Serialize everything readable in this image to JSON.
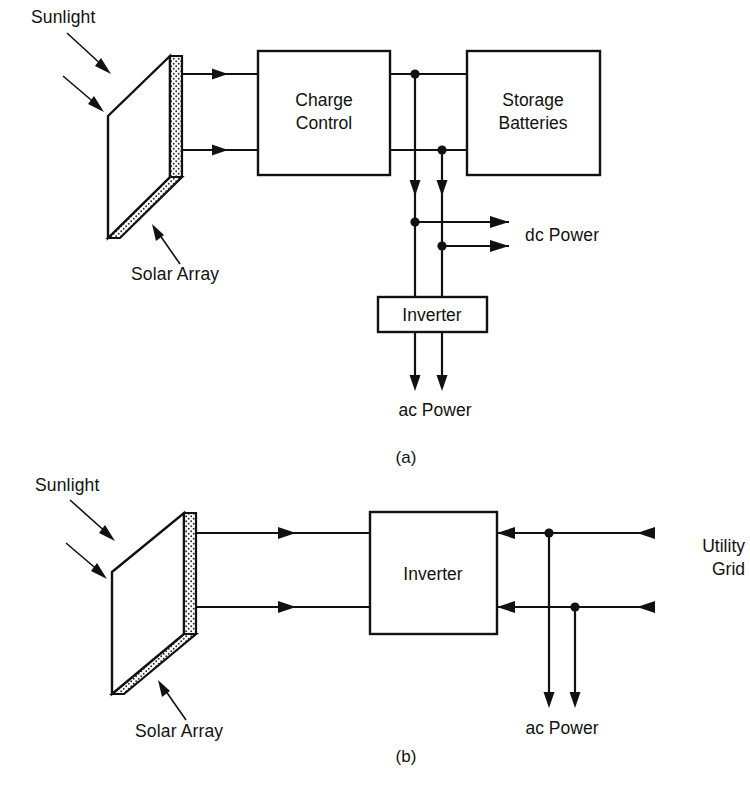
{
  "figure": {
    "background": "#ffffff",
    "ink": "#111111"
  },
  "panel_a": {
    "caption": "(a)",
    "sunlight_label": "Sunlight",
    "solar_array_label": "Solar Array",
    "blocks": [
      {
        "id": "charge-control",
        "line1": "Charge",
        "line2": "Control"
      },
      {
        "id": "storage-batteries",
        "line1": "Storage",
        "line2": "Batteries"
      },
      {
        "id": "inverter",
        "line1": "Inverter",
        "line2": ""
      }
    ],
    "charge_control_line1": "Charge",
    "charge_control_line2": "Control",
    "storage_line1": "Storage",
    "storage_line2": "Batteries",
    "inverter_label": "Inverter",
    "dc_power_label": "dc Power",
    "ac_power_label": "ac Power"
  },
  "panel_b": {
    "caption": "(b)",
    "sunlight_label": "Sunlight",
    "solar_array_label": "Solar Array",
    "inverter_label": "Inverter",
    "utility_line1": "Utility",
    "utility_line2": "Grid",
    "ac_power_label": "ac Power"
  }
}
